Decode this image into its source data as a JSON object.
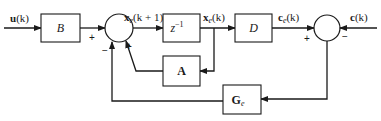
{
  "diagram": {
    "type": "control-system-block-diagram",
    "signals": {
      "input": "u(k)",
      "state_next": "x_e(k + 1)",
      "state": "x_e(k)",
      "estimated_output": "c_e(k)",
      "measured_output": "c(k)"
    },
    "blocks": {
      "input_matrix": "B",
      "delay": "z",
      "delay_exp": "−1",
      "output_matrix": "D",
      "system_matrix": "A",
      "observer_gain": "G",
      "observer_gain_sub": "e"
    },
    "junctions": {
      "sum1": {
        "signs": [
          "+",
          "+",
          "−"
        ]
      },
      "sum2": {
        "signs": [
          "+",
          "−"
        ]
      }
    },
    "labels": {
      "u": "u",
      "u_arg": "(k)",
      "x": "x",
      "x_sub": "e",
      "x_next_arg": "(k + 1)",
      "x_arg": "(k)",
      "c": "c",
      "c_sub": "e",
      "c_arg": "(k)",
      "cmeas": "c",
      "cmeas_arg": "(k)"
    },
    "signs": {
      "plus": "+",
      "minus": "−"
    }
  }
}
